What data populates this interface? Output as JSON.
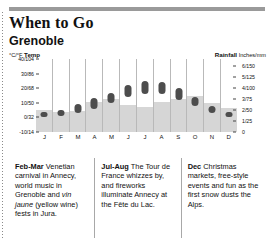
{
  "header": {
    "title": "When to Go",
    "subtitle": "Grenoble"
  },
  "axis_captions": {
    "left_unit": "°C/°F",
    "left_label": "Temp",
    "right_label": "Rainfall",
    "right_unit": "Inches/mm"
  },
  "chart_data": {
    "type": "bar",
    "subtitle": "Grenoble",
    "categories": [
      "J",
      "F",
      "M",
      "A",
      "M",
      "J",
      "J",
      "A",
      "S",
      "O",
      "N",
      "D"
    ],
    "xlabel": "",
    "grid": false,
    "legend": "none",
    "series": [
      {
        "name": "Rainfall",
        "type": "bar",
        "unit": "Inches/mm",
        "ylabel": "Rainfall",
        "ylim": [
          0,
          6.6
        ],
        "ticks": [
          "6/150",
          "5/125",
          "4/100",
          "3/75",
          "2/50",
          "1/25",
          "0"
        ],
        "tick_values": [
          6,
          5,
          4,
          3,
          2,
          1,
          0
        ],
        "values": [
          2.0,
          1.8,
          1.9,
          2.7,
          3.0,
          2.4,
          2.3,
          2.7,
          3.0,
          3.3,
          2.6,
          2.2
        ]
      },
      {
        "name": "Temp range",
        "type": "range",
        "unit": "°C/°F",
        "ylabel": "Temp",
        "ylim": [
          -10,
          40
        ],
        "ticks": [
          "40/104",
          "30/86",
          "20/68",
          "10/50",
          "0/32",
          "-10/14"
        ],
        "tick_values": [
          40,
          30,
          20,
          10,
          0,
          -10
        ],
        "low": [
          0,
          1,
          3,
          6,
          10,
          14,
          16,
          16,
          12,
          8,
          3,
          0
        ],
        "high": [
          4,
          5,
          9,
          13,
          17,
          22,
          25,
          24,
          20,
          14,
          8,
          4
        ]
      }
    ]
  },
  "panels": [
    {
      "name": "feb-mar",
      "lead": "Feb-Mar",
      "text_1": " Venetian carnival in Annecy, world music in Grenoble and ",
      "italic": "vin jaune",
      "text_2": " (yellow wine) fests in Jura."
    },
    {
      "name": "jul-aug",
      "lead": "Jul-Aug",
      "text_1": " The Tour de France whizzes by, and fireworks illuminate Annecy at the Fête du Lac.",
      "italic": "",
      "text_2": ""
    },
    {
      "name": "dec",
      "lead": "Dec",
      "text_1": " Christmas markets, free-style events and fun as the first snow dusts the Alps.",
      "italic": "",
      "text_2": ""
    }
  ],
  "colors": {
    "rule": "#9a9a9a",
    "rain_bar": "#d6d6d6",
    "temp_dot": "#4d4d4d",
    "column_line": "#b9b9b9",
    "text": "#111111"
  }
}
